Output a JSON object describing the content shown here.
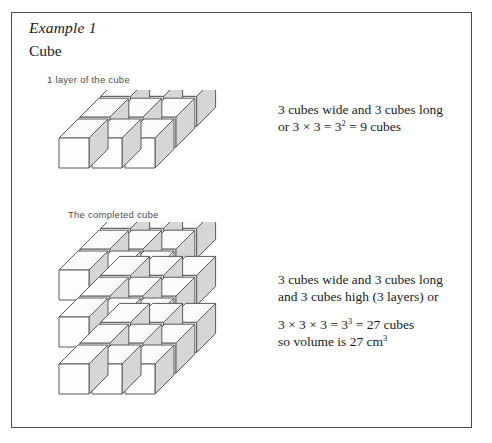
{
  "page": {
    "example_title": "Example 1",
    "section_title": "Cube"
  },
  "figures": {
    "single_layer": {
      "label": "1 layer of the cube",
      "note_line1": "3 cubes wide and 3 cubes long",
      "note_line2_prefix": "or 3 × 3 = 3",
      "note_line2_exponent": "2",
      "note_line2_suffix": " = 9 cubes"
    },
    "completed_cube": {
      "label": "The completed cube",
      "note_line1": "3 cubes wide and 3 cubes long",
      "note_line2": "and 3 cubes high (3 layers) or",
      "note_line3_prefix": "3 × 3 × 3 = 3",
      "note_line3_exponent": "3",
      "note_line3_suffix": " = 27 cubes",
      "note_line4_prefix": "so volume is  27 cm",
      "note_line4_exponent": "3"
    }
  },
  "geometry": {
    "cols": 3,
    "rows": 3,
    "layers": 3,
    "cube_face": 30,
    "depth_x": 19,
    "depth_y": -19,
    "gap": 3,
    "layer_pitch": 47
  },
  "colors": {
    "frame": "#4a4a4a",
    "stroke": "#5a5a5a",
    "face_front": "#fdfdfd",
    "face_top": "#fbfbfb",
    "face_side": "#d6d6d6",
    "text": "#1a1a1a",
    "label_text": "#4d4d4d"
  }
}
